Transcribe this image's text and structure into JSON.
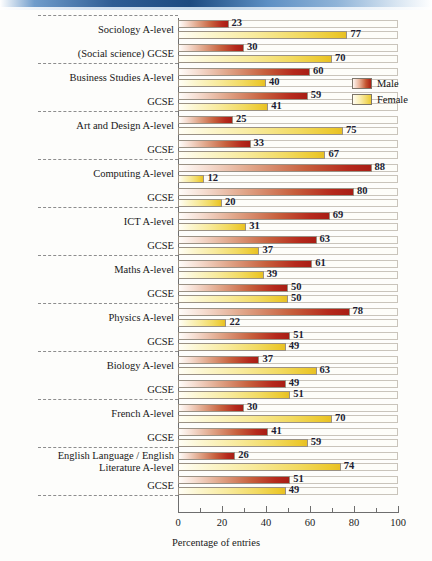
{
  "chart_data": {
    "type": "bar",
    "orientation": "horizontal",
    "title": "",
    "xlabel": "Percentage of entries",
    "ylabel": "",
    "xlim": [
      0,
      100
    ],
    "xticks": [
      0,
      20,
      40,
      60,
      80,
      100
    ],
    "xtick_labels": [
      "0",
      "20",
      "40",
      "60",
      "80",
      "100"
    ],
    "minor_tick_interval": 10,
    "grid": false,
    "legend_position": "upper-right",
    "series": [
      {
        "name": "Male",
        "color": "#b5291c"
      },
      {
        "name": "Female",
        "color": "#ecc92f"
      }
    ],
    "categories": [
      "Sociology A-level",
      "(Social science) GCSE",
      "Business Studies A-level",
      "GCSE",
      "Art and Design A-level",
      "GCSE",
      "Computing A-level",
      "GCSE",
      "ICT A-level",
      "GCSE",
      "Maths A-level",
      "GCSE",
      "Physics A-level",
      "GCSE",
      "Biology A-level",
      "GCSE",
      "French A-level",
      "GCSE",
      "English Language / English Literature A-level",
      "GCSE"
    ],
    "rows": [
      {
        "label": "Sociology A-level",
        "label_lines": [
          "Sociology A-level"
        ],
        "male": 23,
        "female": 77,
        "group_start": true
      },
      {
        "label": "(Social science) GCSE",
        "label_lines": [
          "(Social science) GCSE"
        ],
        "male": 30,
        "female": 70,
        "group_start": false
      },
      {
        "label": "Business Studies A-level",
        "label_lines": [
          "Business Studies A-level"
        ],
        "male": 60,
        "female": 40,
        "group_start": true
      },
      {
        "label": "GCSE",
        "label_lines": [
          "GCSE"
        ],
        "male": 59,
        "female": 41,
        "group_start": false
      },
      {
        "label": "Art and Design A-level",
        "label_lines": [
          "Art and Design A-level"
        ],
        "male": 25,
        "female": 75,
        "group_start": true
      },
      {
        "label": "GCSE",
        "label_lines": [
          "GCSE"
        ],
        "male": 33,
        "female": 67,
        "group_start": false
      },
      {
        "label": "Computing A-level",
        "label_lines": [
          "Computing A-level"
        ],
        "male": 88,
        "female": 12,
        "group_start": true
      },
      {
        "label": "GCSE",
        "label_lines": [
          "GCSE"
        ],
        "male": 80,
        "female": 20,
        "group_start": false
      },
      {
        "label": "ICT A-level",
        "label_lines": [
          "ICT A-level"
        ],
        "male": 69,
        "female": 31,
        "group_start": true
      },
      {
        "label": "GCSE",
        "label_lines": [
          "GCSE"
        ],
        "male": 63,
        "female": 37,
        "group_start": false
      },
      {
        "label": "Maths A-level",
        "label_lines": [
          "Maths A-level"
        ],
        "male": 61,
        "female": 39,
        "group_start": true
      },
      {
        "label": "GCSE",
        "label_lines": [
          "GCSE"
        ],
        "male": 50,
        "female": 50,
        "group_start": false
      },
      {
        "label": "Physics A-level",
        "label_lines": [
          "Physics A-level"
        ],
        "male": 78,
        "female": 22,
        "group_start": true
      },
      {
        "label": "GCSE",
        "label_lines": [
          "GCSE"
        ],
        "male": 51,
        "female": 49,
        "group_start": false
      },
      {
        "label": "Biology A-level",
        "label_lines": [
          "Biology A-level"
        ],
        "male": 37,
        "female": 63,
        "group_start": true
      },
      {
        "label": "GCSE",
        "label_lines": [
          "GCSE"
        ],
        "male": 49,
        "female": 51,
        "group_start": false
      },
      {
        "label": "French A-level",
        "label_lines": [
          "French A-level"
        ],
        "male": 30,
        "female": 70,
        "group_start": true
      },
      {
        "label": "GCSE",
        "label_lines": [
          "GCSE"
        ],
        "male": 41,
        "female": 59,
        "group_start": false
      },
      {
        "label": "English Language / English Literature A-level",
        "label_lines": [
          "English Language / English",
          "Literature A-level"
        ],
        "male": 26,
        "female": 74,
        "group_start": true
      },
      {
        "label": "GCSE",
        "label_lines": [
          "GCSE"
        ],
        "male": 51,
        "female": 49,
        "group_start": false
      }
    ]
  },
  "legend": {
    "items": [
      {
        "label": "Male",
        "key": "male"
      },
      {
        "label": "Female",
        "key": "female"
      }
    ]
  },
  "axis": {
    "x_title": "Percentage of entries"
  },
  "colors": {
    "male_accent": "#b5291c",
    "female_accent": "#ecc92f",
    "axis": "#6e6e6e",
    "text": "#181818",
    "value_text": "#201d33",
    "separator": "#8d8d8d",
    "band": "#2f5d94",
    "background": "#fdfdfb"
  }
}
